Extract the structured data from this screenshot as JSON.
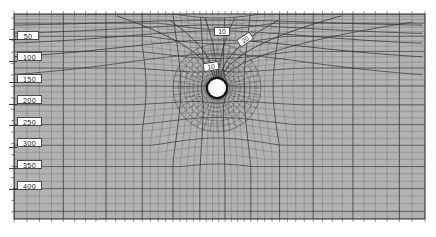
{
  "figure": {
    "kind": "computational-mesh-plot",
    "background_color": "#ffffff",
    "plot_fill_color": "#b2b2b2",
    "mesh_line_color": "#4f4f4f",
    "mesh_line_color_dark": "#2b2b2b",
    "border_color": "#3a3a3a",
    "label_box_fill": "#ffffff",
    "label_text_color": "#1a1a1a",
    "hole_fill_color": "#ffffff",
    "hole_ring_color": "#141414",
    "plot_area": {
      "x": 14,
      "y": 14,
      "width": 411,
      "height": 205
    }
  },
  "chart_data": {
    "type": "mesh",
    "title": "",
    "xlabel": "",
    "ylabel": "",
    "grid": true,
    "legend_position": "none",
    "axis_tick_side": "left-and-top-and-bottom",
    "depth_axis": {
      "name": "depth",
      "tick_labels": [
        "50",
        "100",
        "150",
        "200",
        "250",
        "300",
        "350",
        "400"
      ],
      "tick_values": [
        50,
        100,
        150,
        200,
        250,
        300,
        350,
        400
      ],
      "range": [
        0,
        450
      ],
      "label_pixel_y": [
        35,
        57,
        78,
        100,
        121,
        143,
        164,
        185
      ],
      "label_pixel_x": 20
    },
    "annotations": [
      {
        "text": "10",
        "x": 222,
        "y": 31,
        "rotation_deg": 0,
        "note": "upper contour band label"
      },
      {
        "text": "20",
        "x": 245,
        "y": 39,
        "rotation_deg": -34,
        "note": "second contour band label"
      },
      {
        "text": "10",
        "x": 211,
        "y": 66,
        "rotation_deg": -9,
        "note": "near-hole contour label"
      }
    ],
    "hole": {
      "shape": "circle",
      "center_x": 217,
      "center_y": 88,
      "radius": 9.0,
      "ring_thickness": 2.2,
      "description": "circular opening with radially refined mesh"
    },
    "mesh_description": {
      "structured_columns": 46,
      "structured_rows": 34,
      "radial_rings": 9,
      "radial_spokes": 40,
      "refinement_center": [
        217,
        88
      ],
      "vertical_grading": "rows compress toward the bottom of the domain",
      "horizontal_grading": "columns compress toward the hole at mid-upper region"
    }
  },
  "axis_labels": [
    {
      "text": "50"
    },
    {
      "text": "100"
    },
    {
      "text": "150"
    },
    {
      "text": "200"
    },
    {
      "text": "250"
    },
    {
      "text": "300"
    },
    {
      "text": "350"
    },
    {
      "text": "400"
    }
  ],
  "annotation_labels": [
    {
      "text": "10"
    },
    {
      "text": "20"
    },
    {
      "text": "10"
    }
  ]
}
